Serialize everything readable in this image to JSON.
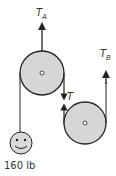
{
  "diagram": {
    "colors": {
      "rope": "#222222",
      "pulley_fill": "#d6d6d6",
      "pulley_stroke": "#222222",
      "face_fill": "#d9d9d9"
    },
    "labels": {
      "tension_a_main": "T",
      "tension_a_sub": "A",
      "tension_b_main": "T",
      "tension_b_sub": "B",
      "tension_t": "T",
      "weight": "160 lb"
    },
    "elements": {
      "upper_pulley": {
        "cx": 42,
        "cy": 73,
        "r": 22
      },
      "lower_pulley": {
        "cx": 85,
        "cy": 123,
        "r": 21
      },
      "weight_face": {
        "cx": 21,
        "cy": 143,
        "r": 11
      }
    }
  }
}
